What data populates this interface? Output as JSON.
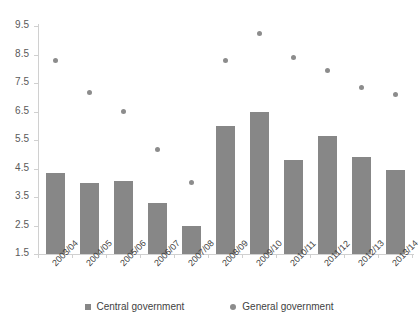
{
  "chart_data": {
    "type": "bar",
    "title": "",
    "subtitle": "",
    "xlabel": "",
    "ylabel": "",
    "ylim": [
      1.5,
      9.5
    ],
    "ytick_step": 1.0,
    "ytick_labels": [
      "9.5",
      "8.5",
      "7.5",
      "6.5",
      "5.5",
      "4.5",
      "3.5",
      "2.5",
      "1.5"
    ],
    "ytick_values": [
      9.5,
      8.5,
      7.5,
      6.5,
      5.5,
      4.5,
      3.5,
      2.5,
      1.5
    ],
    "grid": false,
    "legend_position": "bottom",
    "categories": [
      "2003/04",
      "2004/05",
      "2005/06",
      "2006/07",
      "2007/08",
      "2008/09",
      "2009/10",
      "2010/11",
      "2011/12",
      "2012/13",
      "2013/14"
    ],
    "series": [
      {
        "name": "Central government",
        "marker": "bar",
        "color": "#878787",
        "values": [
          4.35,
          4.0,
          4.05,
          3.3,
          2.5,
          6.0,
          6.5,
          4.8,
          5.65,
          4.9,
          4.45
        ]
      },
      {
        "name": "General government",
        "marker": "circle",
        "color": "#8c8c8c",
        "values": [
          8.3,
          7.15,
          6.5,
          5.15,
          4.0,
          8.3,
          9.25,
          8.4,
          7.95,
          7.35,
          7.1
        ]
      }
    ]
  },
  "legend": {
    "items": [
      {
        "label": "Central government",
        "marker": "square-marker-icon"
      },
      {
        "label": "General government",
        "marker": "circle-marker-icon"
      }
    ]
  }
}
